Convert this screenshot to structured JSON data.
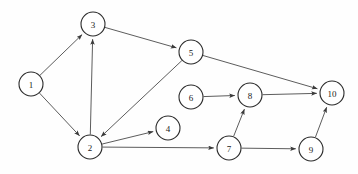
{
  "diagram": {
    "type": "directed-graph",
    "background_color": "#fefefe",
    "node_fill_color": "#ffffff",
    "node_stroke_color": "#2b2b2b",
    "edge_color": "#4a4a4a",
    "label_color": "#1a1a1a",
    "node_radius": 12,
    "canvas": {
      "width": 358,
      "height": 174
    },
    "nodes": [
      {
        "id": "1",
        "label": "1",
        "x": 31,
        "y": 84
      },
      {
        "id": "2",
        "label": "2",
        "x": 90,
        "y": 147
      },
      {
        "id": "3",
        "label": "3",
        "x": 93,
        "y": 24
      },
      {
        "id": "4",
        "label": "4",
        "x": 168,
        "y": 128
      },
      {
        "id": "5",
        "label": "5",
        "x": 191,
        "y": 52
      },
      {
        "id": "6",
        "label": "6",
        "x": 191,
        "y": 97
      },
      {
        "id": "7",
        "label": "7",
        "x": 229,
        "y": 148
      },
      {
        "id": "8",
        "label": "8",
        "x": 250,
        "y": 95
      },
      {
        "id": "9",
        "label": "9",
        "x": 311,
        "y": 149
      },
      {
        "id": "10",
        "label": "10",
        "x": 332,
        "y": 93
      }
    ],
    "edges": [
      {
        "from": "1",
        "to": "3",
        "directed": true
      },
      {
        "from": "1",
        "to": "2",
        "directed": true
      },
      {
        "from": "2",
        "to": "3",
        "directed": true
      },
      {
        "from": "3",
        "to": "5",
        "directed": true
      },
      {
        "from": "5",
        "to": "2",
        "directed": true
      },
      {
        "from": "5",
        "to": "10",
        "directed": true
      },
      {
        "from": "2",
        "to": "4",
        "directed": true
      },
      {
        "from": "2",
        "to": "7",
        "directed": true
      },
      {
        "from": "6",
        "to": "8",
        "directed": true
      },
      {
        "from": "7",
        "to": "8",
        "directed": true
      },
      {
        "from": "7",
        "to": "9",
        "directed": true
      },
      {
        "from": "9",
        "to": "10",
        "directed": true
      },
      {
        "from": "8",
        "to": "10",
        "directed": true
      }
    ]
  }
}
